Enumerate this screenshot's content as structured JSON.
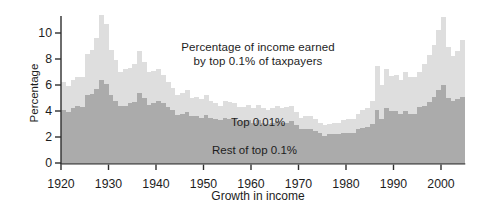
{
  "labels": {
    "title_line1": "Percentage of income earned",
    "title_line2": "by top 0.1% of taxpayers",
    "series_top": "Top 0.01%",
    "series_rest": "Rest of top 0.1%",
    "xlabel": "Growth in income",
    "ylabel": "Percentage"
  },
  "colors": {
    "top001": "#dedede",
    "rest": "#ababab",
    "axis": "#2e2e2e",
    "text": "#1d1d1d",
    "background": "#ffffff"
  },
  "chart_data": {
    "type": "bar",
    "stacked": true,
    "title": "Percentage of income earned by top 0.1% of taxpayers",
    "xlabel": "Growth in income",
    "ylabel": "Percentage",
    "legend_position": "inline-annotations",
    "grid": false,
    "ylim": [
      0,
      11.5
    ],
    "y_ticks": [
      0,
      2,
      4,
      6,
      8,
      10
    ],
    "x_ticks": [
      1920,
      1930,
      1940,
      1950,
      1960,
      1970,
      1980,
      1990,
      2000
    ],
    "years": [
      1920,
      1921,
      1922,
      1923,
      1924,
      1925,
      1926,
      1927,
      1928,
      1929,
      1930,
      1931,
      1932,
      1933,
      1934,
      1935,
      1936,
      1937,
      1938,
      1939,
      1940,
      1941,
      1942,
      1943,
      1944,
      1945,
      1946,
      1947,
      1948,
      1949,
      1950,
      1951,
      1952,
      1953,
      1954,
      1955,
      1956,
      1957,
      1958,
      1959,
      1960,
      1961,
      1962,
      1963,
      1964,
      1965,
      1966,
      1967,
      1968,
      1969,
      1970,
      1971,
      1972,
      1973,
      1974,
      1975,
      1976,
      1977,
      1978,
      1979,
      1980,
      1981,
      1982,
      1983,
      1984,
      1985,
      1986,
      1987,
      1988,
      1989,
      1990,
      1991,
      1992,
      1993,
      1994,
      1995,
      1996,
      1997,
      1998,
      1999,
      2000,
      2001,
      2002,
      2003,
      2004
    ],
    "series": [
      {
        "name": "Rest of top 0.1%",
        "color": "#ababab",
        "values": [
          4.1,
          3.9,
          4.2,
          4.4,
          4.3,
          5.2,
          5.3,
          5.7,
          6.4,
          6.1,
          5.2,
          4.8,
          4.4,
          4.4,
          4.6,
          4.7,
          5.4,
          5.0,
          4.5,
          4.6,
          4.8,
          4.6,
          4.3,
          4.1,
          3.7,
          3.8,
          3.9,
          3.6,
          3.6,
          3.5,
          3.7,
          3.5,
          3.4,
          3.3,
          3.5,
          3.4,
          3.4,
          3.2,
          3.2,
          3.3,
          3.1,
          3.3,
          3.1,
          3.0,
          3.1,
          3.2,
          3.1,
          3.1,
          3.2,
          2.9,
          2.6,
          2.6,
          2.6,
          2.5,
          2.3,
          2.1,
          2.2,
          2.2,
          2.2,
          2.3,
          2.3,
          2.3,
          2.6,
          2.7,
          2.8,
          3.0,
          4.1,
          3.4,
          4.2,
          4.0,
          4.0,
          3.8,
          4.0,
          3.8,
          3.8,
          4.3,
          4.4,
          4.7,
          5.1,
          5.6,
          6.0,
          5.0,
          4.8,
          4.9,
          5.1
        ]
      },
      {
        "name": "Top 0.01%",
        "color": "#dedede",
        "values": [
          2.1,
          2.0,
          2.2,
          2.2,
          2.3,
          3.2,
          3.4,
          3.9,
          5.0,
          4.6,
          3.5,
          3.1,
          2.6,
          2.8,
          2.7,
          2.9,
          3.2,
          2.8,
          2.5,
          2.5,
          2.4,
          2.2,
          1.9,
          1.7,
          1.5,
          1.6,
          1.7,
          1.4,
          1.5,
          1.4,
          1.5,
          1.3,
          1.2,
          1.1,
          1.3,
          1.3,
          1.2,
          1.1,
          1.1,
          1.2,
          1.1,
          1.2,
          1.1,
          1.1,
          1.1,
          1.2,
          1.1,
          1.2,
          1.2,
          1.0,
          0.9,
          1.0,
          1.0,
          0.9,
          0.8,
          0.8,
          0.8,
          0.9,
          0.9,
          1.0,
          1.1,
          1.1,
          1.2,
          1.4,
          1.4,
          1.8,
          3.4,
          2.6,
          3.0,
          2.7,
          2.8,
          2.6,
          3.0,
          2.8,
          2.8,
          2.7,
          3.2,
          3.6,
          4.0,
          4.6,
          5.2,
          3.9,
          3.4,
          3.7,
          4.4
        ]
      }
    ]
  }
}
